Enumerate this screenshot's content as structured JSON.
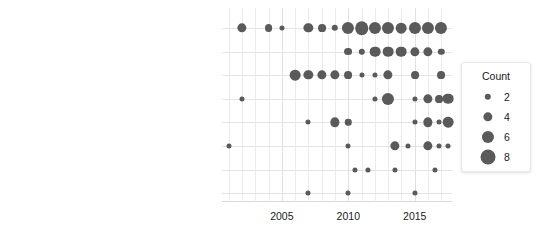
{
  "chart_data": {
    "type": "scatter",
    "title": "",
    "subtitle": "",
    "xlabel": "",
    "ylabel": "",
    "grid": true,
    "xlim": [
      2000.5,
      2017.8
    ],
    "xticks": [
      2005,
      2010,
      2015
    ],
    "xtick_labels": [
      "2005",
      "2010",
      "2015"
    ],
    "categories": [
      "Medical imaging",
      "Safe City or Smart City",
      "E-government",
      "Advanced computing and data storage",
      "Remote sensing and seismic monitoring",
      "Security scanners",
      "Unmanned vehicles",
      "Other"
    ],
    "size_encoding": "Count",
    "size_legend": {
      "title": "Count",
      "values": [
        2,
        4,
        6,
        8
      ],
      "labels": [
        "2",
        "4",
        "6",
        "8"
      ],
      "position": "right"
    },
    "series": [
      {
        "name": "Medical imaging",
        "points": [
          {
            "x": 2002,
            "count": 4
          },
          {
            "x": 2004,
            "count": 3
          },
          {
            "x": 2005,
            "count": 1
          },
          {
            "x": 2007,
            "count": 4
          },
          {
            "x": 2008,
            "count": 3
          },
          {
            "x": 2009,
            "count": 2
          },
          {
            "x": 2010,
            "count": 6
          },
          {
            "x": 2011,
            "count": 7
          },
          {
            "x": 2012,
            "count": 6
          },
          {
            "x": 2013,
            "count": 6
          },
          {
            "x": 2014,
            "count": 5
          },
          {
            "x": 2015,
            "count": 6
          },
          {
            "x": 2016,
            "count": 6
          },
          {
            "x": 2017,
            "count": 6
          }
        ]
      },
      {
        "name": "Safe City or Smart City",
        "points": [
          {
            "x": 2010,
            "count": 3
          },
          {
            "x": 2011,
            "count": 2
          },
          {
            "x": 2012,
            "count": 5
          },
          {
            "x": 2013,
            "count": 5
          },
          {
            "x": 2014,
            "count": 5
          },
          {
            "x": 2015,
            "count": 4
          },
          {
            "x": 2016,
            "count": 4
          },
          {
            "x": 2017,
            "count": 2
          }
        ]
      },
      {
        "name": "E-government",
        "points": [
          {
            "x": 2006,
            "count": 5
          },
          {
            "x": 2007,
            "count": 4
          },
          {
            "x": 2008,
            "count": 4
          },
          {
            "x": 2009,
            "count": 4
          },
          {
            "x": 2010,
            "count": 3
          },
          {
            "x": 2011,
            "count": 1
          },
          {
            "x": 2012,
            "count": 1
          },
          {
            "x": 2013,
            "count": 4
          },
          {
            "x": 2015,
            "count": 3
          },
          {
            "x": 2017,
            "count": 3
          }
        ]
      },
      {
        "name": "Advanced computing and data storage",
        "points": [
          {
            "x": 2002,
            "count": 1
          },
          {
            "x": 2012,
            "count": 1
          },
          {
            "x": 2013,
            "count": 6
          },
          {
            "x": 2015,
            "count": 1
          },
          {
            "x": 2016,
            "count": 4
          },
          {
            "x": 2016.8,
            "count": 3
          },
          {
            "x": 2017.5,
            "count": 5
          }
        ]
      },
      {
        "name": "Remote sensing and seismic monitoring",
        "points": [
          {
            "x": 2007,
            "count": 1
          },
          {
            "x": 2009,
            "count": 4
          },
          {
            "x": 2010,
            "count": 2
          },
          {
            "x": 2015,
            "count": 1
          },
          {
            "x": 2016,
            "count": 4
          },
          {
            "x": 2016.8,
            "count": 1
          },
          {
            "x": 2017.5,
            "count": 5
          }
        ]
      },
      {
        "name": "Security scanners",
        "points": [
          {
            "x": 2001,
            "count": 1
          },
          {
            "x": 2010,
            "count": 1
          },
          {
            "x": 2013.5,
            "count": 4
          },
          {
            "x": 2014.5,
            "count": 1
          },
          {
            "x": 2016,
            "count": 4
          },
          {
            "x": 2016.8,
            "count": 1
          },
          {
            "x": 2017.5,
            "count": 1
          }
        ]
      },
      {
        "name": "Unmanned vehicles",
        "points": [
          {
            "x": 2010.5,
            "count": 1
          },
          {
            "x": 2011.5,
            "count": 1
          },
          {
            "x": 2013.5,
            "count": 1
          },
          {
            "x": 2016.5,
            "count": 1
          }
        ]
      },
      {
        "name": "Other",
        "points": [
          {
            "x": 2007,
            "count": 1
          },
          {
            "x": 2010,
            "count": 1
          },
          {
            "x": 2015,
            "count": 1
          }
        ]
      }
    ]
  }
}
